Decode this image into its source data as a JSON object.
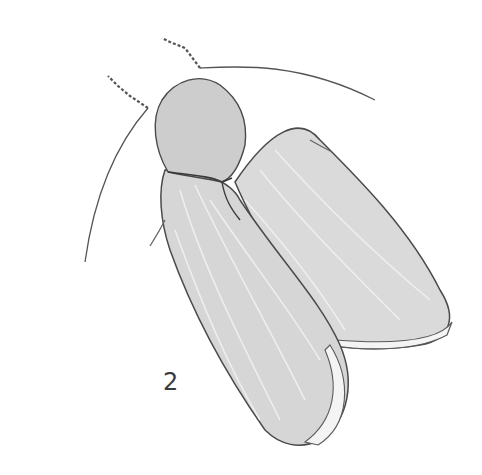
{
  "figure": {
    "number": "2",
    "colors": {
      "background": "#ffffff",
      "wing_fill": "#d9d9d9",
      "thorax_fill": "#cfcfcf",
      "outline": "#4a4a4a",
      "vein": "#f2f2f2"
    }
  }
}
